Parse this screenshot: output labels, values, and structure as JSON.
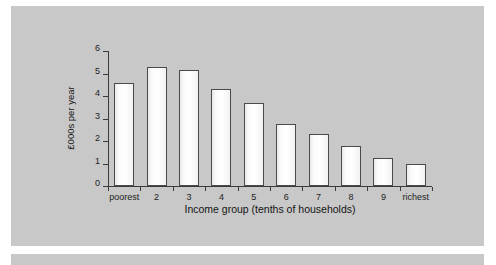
{
  "chart_data": {
    "type": "bar",
    "title": "",
    "xlabel": "Income group (tenths of households)",
    "ylabel": "£000s per year",
    "categories": [
      "poorest",
      "2",
      "3",
      "4",
      "5",
      "6",
      "7",
      "8",
      "9",
      "richest"
    ],
    "values": [
      4.6,
      5.3,
      5.15,
      4.3,
      3.7,
      2.75,
      2.3,
      1.8,
      1.25,
      1.0
    ],
    "ylim": [
      0,
      6
    ],
    "yticks": [
      "0",
      "1",
      "2",
      "3",
      "4",
      "5",
      "6"
    ],
    "ytick_values": [
      0,
      1,
      2,
      3,
      4,
      5,
      6
    ],
    "grid": false,
    "legend": "none"
  },
  "style": {
    "panel_color": "#c8c8c8",
    "bar_fill": "#fdfdfd",
    "bar_outline": "#4a4a4a",
    "axis_color": "#3b3b3b",
    "text_color": "#141414"
  }
}
